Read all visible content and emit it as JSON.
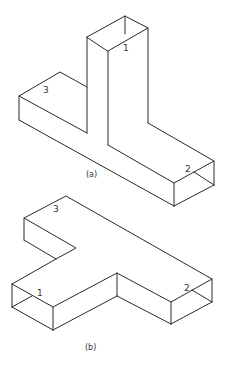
{
  "figure": {
    "line_color": "#2a2a2a",
    "background": "#ffffff"
  },
  "diagram_a": {
    "caption": "(a)",
    "labels": {
      "port1": "1",
      "port2": "2",
      "port3": "3"
    }
  },
  "diagram_b": {
    "caption": "(b)",
    "labels": {
      "port1": "1",
      "port2": "2",
      "port3": "3"
    }
  }
}
